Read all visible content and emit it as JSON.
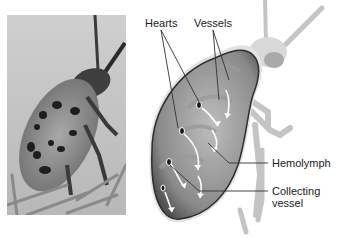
{
  "figure": {
    "photo": {
      "subject": "spotted cucumber beetle",
      "alt": "Photograph of a spotted beetle on a plant"
    },
    "labels": {
      "hearts": "Hearts",
      "vessels": "Vessels",
      "hemolymph": "Hemolymph",
      "collecting_line1": "Collecting",
      "collecting_line2": "vessel"
    }
  }
}
